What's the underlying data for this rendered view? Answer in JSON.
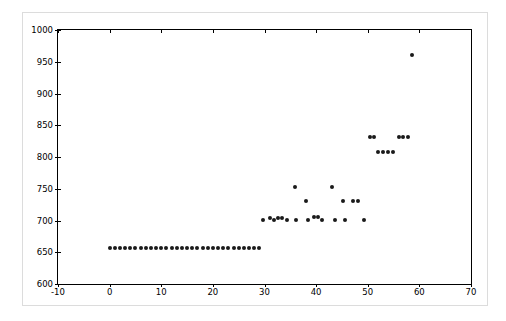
{
  "figure": {
    "background_color": "#ffffff",
    "frame_color": "#dcdcdc",
    "axes_color": "#000000",
    "marker_color": "#1a1a1a"
  },
  "chart_data": {
    "type": "scatter",
    "title": "",
    "xlabel": "",
    "ylabel": "",
    "xlim": [
      -10,
      70
    ],
    "ylim": [
      600,
      1000
    ],
    "xticks": [
      -10,
      0,
      10,
      20,
      30,
      40,
      50,
      60,
      70
    ],
    "xticklabels": [
      "-10",
      "0",
      "10",
      "20",
      "30",
      "40",
      "50",
      "60",
      "70"
    ],
    "yticks": [
      600,
      650,
      700,
      750,
      800,
      850,
      900,
      950,
      1000
    ],
    "yticklabels": [
      "600",
      "650",
      "700",
      "750",
      "800",
      "850",
      "900",
      "950",
      "1000"
    ],
    "grid": false,
    "legend": null,
    "marker": "circle",
    "marker_size": 4,
    "series": [
      {
        "name": "series-1",
        "color": "#1a1a1a",
        "x": [
          0,
          1,
          2,
          3,
          4,
          5,
          6,
          7,
          8,
          9,
          10,
          11,
          12,
          13,
          14,
          15,
          16,
          17,
          18,
          19,
          20,
          21,
          22,
          23,
          24,
          25,
          26,
          27,
          28,
          29,
          30,
          31,
          32,
          33,
          34,
          35,
          36,
          37,
          38,
          39,
          40,
          41,
          42,
          43,
          44,
          45,
          46,
          47,
          48,
          49,
          50,
          51,
          52,
          53,
          54,
          55,
          56,
          58
        ],
        "y": [
          657,
          657,
          657,
          657,
          657,
          657,
          657,
          657,
          657,
          657,
          657,
          657,
          657,
          657,
          657,
          657,
          657,
          657,
          657,
          657,
          657,
          657,
          657,
          657,
          657,
          657,
          657,
          657,
          657,
          657,
          701,
          704,
          701,
          704,
          704,
          701,
          752,
          701,
          730,
          701,
          705,
          705,
          701,
          752,
          701,
          730,
          701,
          730,
          730,
          701,
          832,
          832,
          808,
          808,
          808,
          808,
          832,
          961
        ]
      }
    ],
    "points": [
      {
        "x": 0,
        "y": 657
      },
      {
        "x": 1,
        "y": 657
      },
      {
        "x": 2,
        "y": 657
      },
      {
        "x": 3,
        "y": 657
      },
      {
        "x": 4,
        "y": 657
      },
      {
        "x": 5,
        "y": 657
      },
      {
        "x": 6,
        "y": 657
      },
      {
        "x": 7,
        "y": 657
      },
      {
        "x": 8,
        "y": 657
      },
      {
        "x": 9,
        "y": 657
      },
      {
        "x": 10,
        "y": 657
      },
      {
        "x": 11,
        "y": 657
      },
      {
        "x": 12,
        "y": 657
      },
      {
        "x": 13,
        "y": 657
      },
      {
        "x": 14,
        "y": 657
      },
      {
        "x": 15,
        "y": 657
      },
      {
        "x": 16,
        "y": 657
      },
      {
        "x": 17,
        "y": 657
      },
      {
        "x": 18,
        "y": 657
      },
      {
        "x": 19,
        "y": 657
      },
      {
        "x": 20,
        "y": 657
      },
      {
        "x": 21,
        "y": 657
      },
      {
        "x": 22,
        "y": 657
      },
      {
        "x": 23,
        "y": 657
      },
      {
        "x": 24,
        "y": 657
      },
      {
        "x": 25,
        "y": 657
      },
      {
        "x": 26,
        "y": 657
      },
      {
        "x": 27,
        "y": 657
      },
      {
        "x": 28,
        "y": 657
      },
      {
        "x": 29,
        "y": 657
      },
      {
        "x": 29.8,
        "y": 701
      },
      {
        "x": 31.0,
        "y": 704
      },
      {
        "x": 31.9,
        "y": 701
      },
      {
        "x": 32.7,
        "y": 704
      },
      {
        "x": 33.4,
        "y": 704
      },
      {
        "x": 34.3,
        "y": 701
      },
      {
        "x": 36.0,
        "y": 752
      },
      {
        "x": 36.1,
        "y": 701
      },
      {
        "x": 38.0,
        "y": 730
      },
      {
        "x": 38.4,
        "y": 701
      },
      {
        "x": 39.6,
        "y": 705
      },
      {
        "x": 40.3,
        "y": 705
      },
      {
        "x": 41.2,
        "y": 701
      },
      {
        "x": 43.0,
        "y": 752
      },
      {
        "x": 43.6,
        "y": 701
      },
      {
        "x": 45.3,
        "y": 730
      },
      {
        "x": 45.5,
        "y": 701
      },
      {
        "x": 47.2,
        "y": 730
      },
      {
        "x": 48.1,
        "y": 730
      },
      {
        "x": 49.2,
        "y": 701
      },
      {
        "x": 50.4,
        "y": 832
      },
      {
        "x": 51.3,
        "y": 832
      },
      {
        "x": 52.0,
        "y": 808
      },
      {
        "x": 53.0,
        "y": 808
      },
      {
        "x": 54.0,
        "y": 808
      },
      {
        "x": 54.9,
        "y": 808
      },
      {
        "x": 56.1,
        "y": 832
      },
      {
        "x": 56.9,
        "y": 832
      },
      {
        "x": 57.8,
        "y": 832
      },
      {
        "x": 58.5,
        "y": 961
      }
    ]
  }
}
